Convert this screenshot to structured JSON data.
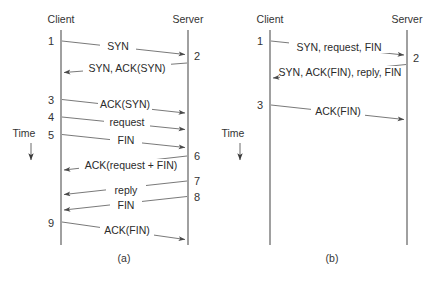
{
  "figure": {
    "colors": {
      "background": "#ffffff",
      "line": "#6a6a6a",
      "lifeline": "#5a5a5a",
      "text": "#333333"
    }
  },
  "panels": [
    {
      "id": "a",
      "caption": "(a)",
      "client_label": "Client",
      "server_label": "Server",
      "time_label": "Time",
      "sequence_numbers": [
        "1",
        "2",
        "3",
        "4",
        "5",
        "6",
        "7",
        "8",
        "9"
      ],
      "messages": [
        {
          "seq": "1",
          "label": "SYN",
          "direction": "client-to-server"
        },
        {
          "seq": "2",
          "label": "SYN, ACK(SYN)",
          "direction": "server-to-client"
        },
        {
          "seq": "3",
          "label": "ACK(SYN)",
          "direction": "client-to-server"
        },
        {
          "seq": "4",
          "label": "request",
          "direction": "client-to-server"
        },
        {
          "seq": "5",
          "label": "FIN",
          "direction": "client-to-server"
        },
        {
          "seq": "6",
          "label": "ACK(request + FIN)",
          "direction": "server-to-client"
        },
        {
          "seq": "7",
          "label": "reply",
          "direction": "server-to-client"
        },
        {
          "seq": "8",
          "label": "FIN",
          "direction": "server-to-client"
        },
        {
          "seq": "9",
          "label": "ACK(FIN)",
          "direction": "client-to-server"
        }
      ]
    },
    {
      "id": "b",
      "caption": "(b)",
      "client_label": "Client",
      "server_label": "Server",
      "time_label": "Time",
      "sequence_numbers": [
        "1",
        "2",
        "3"
      ],
      "messages": [
        {
          "seq": "1",
          "label": "SYN, request, FIN",
          "direction": "client-to-server"
        },
        {
          "seq": "2",
          "label": "SYN, ACK(FIN), reply, FIN",
          "direction": "server-to-client"
        },
        {
          "seq": "3",
          "label": "ACK(FIN)",
          "direction": "client-to-server"
        }
      ]
    }
  ]
}
